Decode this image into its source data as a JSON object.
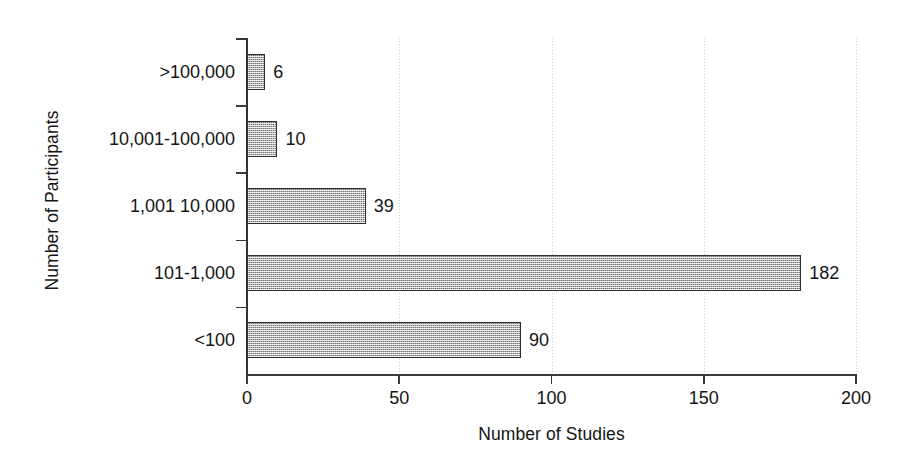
{
  "chart_data": {
    "type": "bar",
    "orientation": "horizontal",
    "title": "",
    "xlabel": "Number of Studies",
    "ylabel": "Number of Participants",
    "categories": [
      ">100,000",
      "10,001-100,000",
      "1,001 10,000",
      "101-1,000",
      "<100"
    ],
    "values": [
      6,
      10,
      39,
      182,
      90
    ],
    "value_labels": [
      "6",
      "10",
      "39",
      "182",
      "90"
    ],
    "xlim": [
      0,
      200
    ],
    "xticks": [
      0,
      50,
      100,
      150,
      200
    ],
    "xtick_labels": [
      "0",
      "50",
      "100",
      "150",
      "200"
    ],
    "grid": {
      "vertical": true,
      "horizontal": false,
      "style": "dotted",
      "color": "#c9c9c9"
    },
    "legend": null,
    "colors": {
      "bar_fill": "#b3b3b3",
      "bar_edge": "#2e2e2e",
      "axis": "#3a3a3a",
      "text": "#141414",
      "background": "#ffffff"
    },
    "series": [
      {
        "name": "Number of Studies",
        "points": [
          {
            "category": ">100,000",
            "value": 6,
            "label": "6"
          },
          {
            "category": "10,001-100,000",
            "value": 10,
            "label": "10"
          },
          {
            "category": "1,001 10,000",
            "value": 39,
            "label": "39"
          },
          {
            "category": "101-1,000",
            "value": 182,
            "label": "182"
          },
          {
            "category": "<100",
            "value": 90,
            "label": "90"
          }
        ]
      }
    ]
  }
}
